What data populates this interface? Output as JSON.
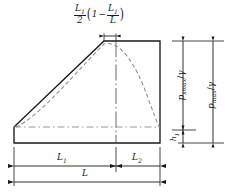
{
  "figure": {
    "colors": {
      "line": "#1a1a1a",
      "dashed": "#8c8c8c",
      "background": "#ffffff"
    },
    "top_formula": {
      "coefficient_numerator": "L",
      "coefficient_numerator_sub": "1",
      "coefficient_denominator": "2",
      "paren_open": "(",
      "one": "1",
      "minus": "−",
      "ratio_numerator": "L",
      "ratio_numerator_sub": "1",
      "ratio_denominator": "L",
      "paren_close": ")",
      "plain": "L1/2 (1 − L1/L)"
    },
    "right_dimensions": [
      {
        "name": "p-smax-over-gamma",
        "symbol": "p",
        "subscript": "smax",
        "divider": "/",
        "denominator": "γ",
        "plain": "p_smax/γ"
      },
      {
        "name": "p-max-over-gamma",
        "symbol": "p",
        "subscript": "max",
        "divider": "/",
        "denominator": "γ",
        "plain": "p_max/γ"
      },
      {
        "name": "h-1",
        "symbol": "h",
        "subscript": "1",
        "divider": "",
        "denominator": "",
        "plain": "h_1"
      }
    ],
    "bottom_dimensions": [
      {
        "name": "L1",
        "symbol": "L",
        "subscript": "1",
        "plain": "L1"
      },
      {
        "name": "L2",
        "symbol": "L",
        "subscript": "2",
        "plain": "L2"
      },
      {
        "name": "L",
        "symbol": "L",
        "subscript": "",
        "plain": "L"
      }
    ],
    "curve": {
      "type": "dashed-parabola",
      "description": "Smooth pressure curve peaking near the solid apex and falling to the base at the right wall"
    },
    "solid_outline": {
      "type": "polygon",
      "description": "Left apex rising to peak, flat top to right edge, vertical right wall, horizontal base strip"
    }
  }
}
